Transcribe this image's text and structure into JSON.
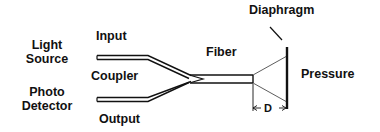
{
  "diagram": {
    "type": "fiber-optic pressure sensor schematic",
    "labels": {
      "light_source_line1": "Light",
      "light_source_line2": "Source",
      "photo_detector_line1": "Photo",
      "photo_detector_line2": "Detector",
      "input": "Input",
      "coupler": "Coupler",
      "output": "Output",
      "fiber": "Fiber",
      "diaphragm": "Diaphragm",
      "pressure": "Pressure",
      "gap": "D"
    },
    "colors": {
      "line": "#111111",
      "background": "#ffffff"
    }
  }
}
